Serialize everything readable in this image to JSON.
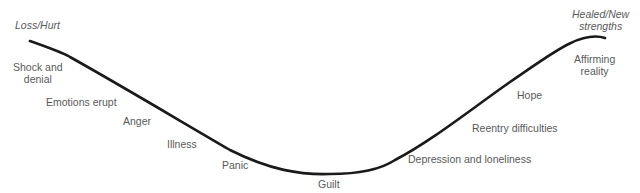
{
  "diagram": {
    "type": "grief-recovery-curve",
    "start_label": "Loss/Hurt",
    "end_label": [
      "Healed/New",
      "strengths"
    ],
    "stages": [
      {
        "label": [
          "Shock and",
          "denial"
        ]
      },
      {
        "label": [
          "Emotions erupt"
        ]
      },
      {
        "label": [
          "Anger"
        ]
      },
      {
        "label": [
          "Illness"
        ]
      },
      {
        "label": [
          "Panic"
        ]
      },
      {
        "label": [
          "Guilt"
        ]
      },
      {
        "label": [
          "Depression and loneliness"
        ]
      },
      {
        "label": [
          "Reentry difficulties"
        ]
      },
      {
        "label": [
          "Hope"
        ]
      },
      {
        "label": [
          "Affirming",
          "reality"
        ]
      }
    ],
    "curve_color": "#1a1a1a"
  }
}
